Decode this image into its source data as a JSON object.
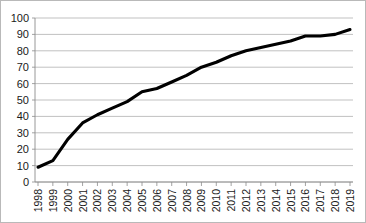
{
  "chart_data": {
    "type": "line",
    "title": "",
    "subtitle": "",
    "xlabel": "",
    "ylabel": "",
    "categories": [
      "1998",
      "1999",
      "2000",
      "2001",
      "2002",
      "2003",
      "2004",
      "2005",
      "2006",
      "2007",
      "2008",
      "2009",
      "2010",
      "2011",
      "2012",
      "2013",
      "2014",
      "2015",
      "2016",
      "2017",
      "2018",
      "2019"
    ],
    "x": [
      1998,
      1999,
      2000,
      2001,
      2002,
      2003,
      2004,
      2005,
      2006,
      2007,
      2008,
      2009,
      2010,
      2011,
      2012,
      2013,
      2014,
      2015,
      2016,
      2017,
      2018,
      2019
    ],
    "values": [
      9,
      13,
      26,
      36,
      41,
      45,
      49,
      55,
      57,
      61,
      65,
      70,
      73,
      77,
      80,
      82,
      84,
      86,
      89,
      89,
      90,
      93
    ],
    "series": [
      {
        "name": "",
        "values": [
          9,
          13,
          26,
          36,
          41,
          45,
          49,
          55,
          57,
          61,
          65,
          70,
          73,
          77,
          80,
          82,
          84,
          86,
          89,
          89,
          90,
          93
        ]
      }
    ],
    "ylim": [
      0,
      100
    ],
    "yticks": [
      0,
      10,
      20,
      30,
      40,
      50,
      60,
      70,
      80,
      90,
      100
    ],
    "ytick_labels": [
      "0",
      "10",
      "20",
      "30",
      "40",
      "50",
      "60",
      "70",
      "80",
      "90",
      "100"
    ],
    "xtick_labels": [
      "1998",
      "1999",
      "2000",
      "2001",
      "2002",
      "2003",
      "2004",
      "2005",
      "2006",
      "2007",
      "2008",
      "2009",
      "2010",
      "2011",
      "2012",
      "2013",
      "2014",
      "2015",
      "2016",
      "2017",
      "2018",
      "2019"
    ],
    "xtick_rotation": -90,
    "grid": true,
    "grid_axis": "y",
    "legend": false,
    "legend_position": "none",
    "colors": {
      "series_line": "#000000",
      "gridline": "#a6a6a6",
      "axis": "#8c8c8c",
      "border": "#b9b9b9",
      "background": "#ffffff",
      "tick_text": "#1a1a1a"
    },
    "annotations": []
  },
  "layout": {
    "plot_left": 34,
    "plot_right": 352,
    "plot_top": 17,
    "plot_bottom": 181
  }
}
